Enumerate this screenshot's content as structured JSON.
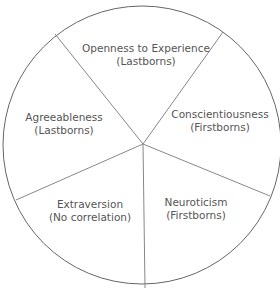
{
  "diagram": {
    "type": "pie-wheel",
    "center": [
      143,
      144
    ],
    "radius": 140,
    "stroke_color": "#777777",
    "background": "#ffffff",
    "segments": [
      {
        "trait": "Openness to Experience",
        "association": "(Lastborns)",
        "pos": [
          146,
          42
        ]
      },
      {
        "trait": "Conscientiousness",
        "association": "(Firstborns)",
        "pos": [
          220,
          108
        ]
      },
      {
        "trait": "Neuroticism",
        "association": "(Firstborns)",
        "pos": [
          196,
          196
        ]
      },
      {
        "trait": "Extraversion",
        "association": "(No correlation)",
        "pos": [
          90,
          198
        ]
      },
      {
        "trait": "Agreeableness",
        "association": "(Lastborns)",
        "pos": [
          64,
          111
        ]
      }
    ],
    "spokes": [
      [
        55,
        34
      ],
      [
        223,
        32
      ],
      [
        270,
        196
      ],
      [
        145,
        288
      ],
      [
        16,
        200
      ]
    ]
  }
}
